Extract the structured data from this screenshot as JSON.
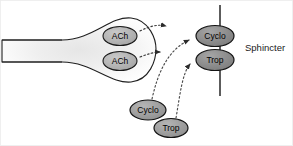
{
  "figure": {
    "background_color": "#ffffff",
    "width": 293,
    "height": 146
  },
  "colors": {
    "outline": "#1a1a1a",
    "terminal_fill_edge": "#ffffff",
    "terminal_fill_center": "#ededed",
    "vesicle_fill": "#b3b3b3",
    "receptor_fill": "#8c8c8c",
    "free_molecule_fill": "#9e9e9e",
    "membrane_line": "#262626",
    "arrow_color": "#3a3a3a",
    "label_text": "#1a1a1a",
    "border": "#e8e8e8"
  },
  "nerve_terminal": {
    "name": "presynaptic nerve terminal",
    "axon_upper_line": true,
    "axon_lower_line": true
  },
  "vesicles": [
    {
      "label": "ACh",
      "cx": 120,
      "cy": 36,
      "rx": 17,
      "ry": 9.5
    },
    {
      "label": "ACh",
      "cx": 120,
      "cy": 61,
      "rx": 17,
      "ry": 9.5
    }
  ],
  "membrane": {
    "label": "Sphincter",
    "x": 220,
    "y_top": 5,
    "y_bottom": 96,
    "label_x": 245,
    "label_y": 48
  },
  "receptors": [
    {
      "label": "Cyclo",
      "cx": 215,
      "cy": 36,
      "rx": 19,
      "ry": 10.5
    },
    {
      "label": "Trop",
      "cx": 215,
      "cy": 60,
      "rx": 19,
      "ry": 10.5
    }
  ],
  "free_molecules": [
    {
      "label": "Cyclo",
      "cx": 148,
      "cy": 110,
      "rx": 18,
      "ry": 10
    },
    {
      "label": "Trop",
      "cx": 171,
      "cy": 128,
      "rx": 17,
      "ry": 9.5
    }
  ],
  "arrows": [
    {
      "name": "ach-release-upper",
      "style": "dotted",
      "from": "vesicle-ach-1",
      "to": "synaptic-cleft"
    },
    {
      "name": "ach-release-lower",
      "style": "dotted",
      "from": "vesicle-ach-2",
      "to": "synaptic-cleft"
    },
    {
      "name": "cyclo-binding",
      "style": "dotted-curve",
      "from": "free-cyclo",
      "to": "receptor-cyclo"
    },
    {
      "name": "trop-binding",
      "style": "dotted-curve",
      "from": "free-trop",
      "to": "receptor-trop"
    }
  ]
}
